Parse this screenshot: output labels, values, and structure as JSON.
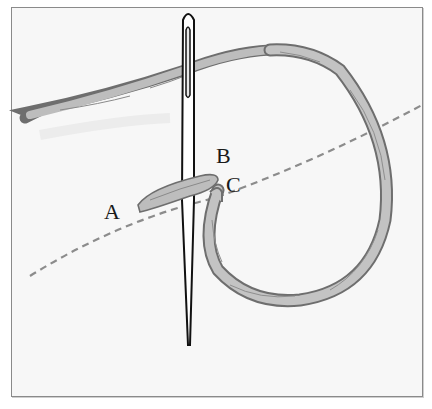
{
  "diagram": {
    "type": "stitch-illustration",
    "labels": {
      "a": "A",
      "b": "B",
      "c": "C"
    },
    "colors": {
      "background": "#f7f7f7",
      "frame_border": "#8a8a8a",
      "thread_fill": "#bdbdbd",
      "thread_outline": "#6e6e6e",
      "needle": "#111111",
      "dashed_line": "#8a8a8a",
      "label_text": "#1a1a1a"
    }
  }
}
